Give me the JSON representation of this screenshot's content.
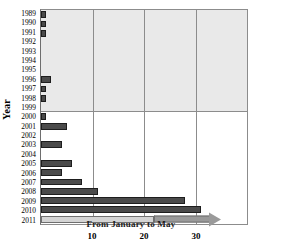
{
  "chart_data": {
    "type": "bar",
    "orientation": "horizontal",
    "title": "",
    "xlabel": "",
    "ylabel": "Year",
    "xlim": [
      0,
      40
    ],
    "ylim": null,
    "grid": true,
    "legend_position": "none",
    "xticks": [
      10,
      20,
      30
    ],
    "categories": [
      "1989",
      "1990",
      "1991",
      "1992",
      "1993",
      "1994",
      "1995",
      "1996",
      "1997",
      "1998",
      "1999",
      "2000",
      "2001",
      "2002",
      "2003",
      "2004",
      "2005",
      "2006",
      "2007",
      "2008",
      "2009",
      "2010",
      "2011"
    ],
    "values": [
      1,
      1,
      1,
      0,
      0,
      0,
      0,
      2,
      1,
      1,
      0,
      1,
      5,
      0,
      4,
      0,
      6,
      4,
      8,
      11,
      28,
      31,
      22
    ],
    "annotations": [
      {
        "text": "From January to May",
        "category": "2011"
      }
    ],
    "colors": {
      "bar": "#4a4a4a",
      "bar_edge": "#1d1d1d",
      "bar_partial": "#d4d4d4",
      "arrow": "#9a9a9a",
      "shaded_region": "#e9e9e9",
      "gridline": "#8c8c8c",
      "axis": "#6e6e6e",
      "background": "#ffffff",
      "text": "#000000"
    }
  }
}
